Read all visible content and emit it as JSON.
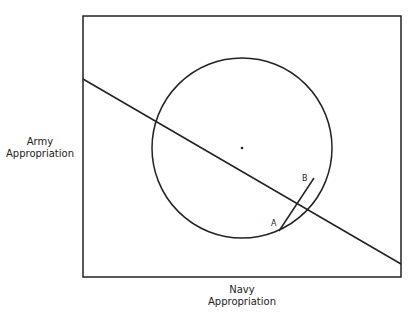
{
  "diagram": {
    "y_axis_label_line1": "Army",
    "y_axis_label_line2": "Appropriation",
    "x_axis_label_line1": "Navy",
    "x_axis_label_line2": "Appropriation",
    "point_a_label": "A",
    "point_b_label": "B",
    "stroke_color": "#222222"
  }
}
